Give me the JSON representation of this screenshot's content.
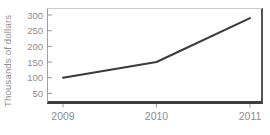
{
  "chart_data": {
    "type": "line",
    "title": "",
    "ylabel": "Thousands of dollars",
    "xlabel": "",
    "categories": [
      "2009",
      "2010",
      "2011"
    ],
    "series": [
      {
        "name": "amount",
        "values": [
          100,
          150,
          290
        ]
      }
    ],
    "yticks": [
      50,
      100,
      150,
      200,
      250,
      300
    ],
    "ylim": [
      0,
      320
    ],
    "grid": false,
    "legend": false,
    "line_color": "#3a3a3a",
    "axis_label_color": "#8e8e8e",
    "tick_mark_color": "#9a9a9a"
  }
}
